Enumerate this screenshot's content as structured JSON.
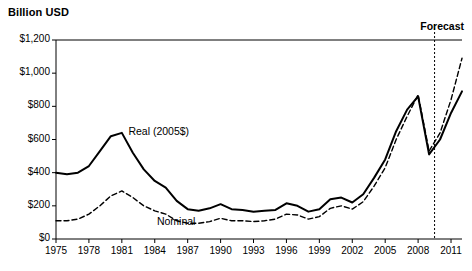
{
  "chart_data": {
    "type": "line",
    "title": "",
    "ylabel": "Billion USD",
    "xlabel": "",
    "ylim": [
      0,
      1200
    ],
    "yticks": [
      "$0",
      "$200",
      "$400",
      "$600",
      "$800",
      "$1,000",
      "$1,200"
    ],
    "ytick_values": [
      0,
      200,
      400,
      600,
      800,
      1000,
      1200
    ],
    "xlim": [
      1975,
      2012
    ],
    "xticks": [
      "1975",
      "1978",
      "1981",
      "1984",
      "1987",
      "1990",
      "1993",
      "1996",
      "1999",
      "2002",
      "2005",
      "2008",
      "2011"
    ],
    "xtick_values": [
      1975,
      1978,
      1981,
      1984,
      1987,
      1990,
      1993,
      1996,
      1999,
      2002,
      2005,
      2008,
      2011
    ],
    "grid": false,
    "legend_position": "inline-annotation",
    "annotations": [
      {
        "name": "forecast-label",
        "text": "Forecast",
        "x": 2009.6
      },
      {
        "name": "real-series-label",
        "text": "Real (2005$)",
        "x": 1981.6,
        "y": 640
      },
      {
        "name": "nominal-series-label",
        "text": "Nominal",
        "x": 1984.2,
        "y": 95
      }
    ],
    "forecast_divider_x": 2009.5,
    "x": [
      1975,
      1976,
      1977,
      1978,
      1979,
      1980,
      1981,
      1982,
      1983,
      1984,
      1985,
      1986,
      1987,
      1988,
      1989,
      1990,
      1991,
      1992,
      1993,
      1994,
      1995,
      1996,
      1997,
      1998,
      1999,
      2000,
      2001,
      2002,
      2003,
      2004,
      2005,
      2006,
      2007,
      2008,
      2009,
      2010,
      2011,
      2012
    ],
    "series": [
      {
        "name": "Real (2005$)",
        "style": "solid",
        "values": [
          400,
          390,
          400,
          440,
          530,
          620,
          640,
          520,
          420,
          350,
          310,
          230,
          180,
          170,
          185,
          210,
          180,
          175,
          165,
          170,
          175,
          215,
          200,
          165,
          180,
          240,
          250,
          220,
          270,
          370,
          480,
          650,
          780,
          860,
          510,
          600,
          760,
          890
        ]
      },
      {
        "name": "Nominal",
        "style": "dashed",
        "values": [
          110,
          110,
          120,
          150,
          200,
          260,
          290,
          250,
          200,
          170,
          150,
          110,
          95,
          95,
          105,
          125,
          110,
          110,
          105,
          110,
          120,
          150,
          145,
          120,
          135,
          185,
          200,
          180,
          225,
          320,
          430,
          600,
          740,
          870,
          530,
          640,
          840,
          1090
        ]
      }
    ]
  }
}
